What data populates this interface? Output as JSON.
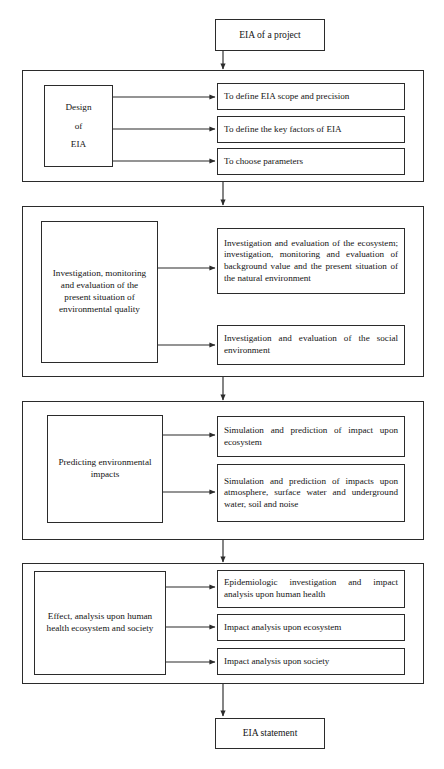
{
  "diagram": {
    "title_box": {
      "label": "EIA of a project"
    },
    "end_box": {
      "label": "EIA statement"
    },
    "stages": [
      {
        "id": "design",
        "stage_label": "Design\n\nof\n\nEIA",
        "stage_label_lines": [
          "Design",
          "of",
          "EIA"
        ],
        "outputs": [
          "To define EIA scope and precision",
          "To define the key factors of EIA",
          "To choose parameters"
        ]
      },
      {
        "id": "investigation",
        "stage_label": "Investigation, monitoring and evaluation of the present situation of environmental quality",
        "outputs": [
          "Investigation and evaluation of the ecosystem; investigation, monitoring and evaluation of background value and the present situation of the natural environment",
          "Investigation and evaluation of the social environment"
        ]
      },
      {
        "id": "prediction",
        "stage_label": "Predicting environmental impacts",
        "outputs": [
          "Simulation and prediction of impact upon ecosystem",
          "Simulation and prediction of impacts upon atmosphere, surface water and underground water, soil and noise"
        ]
      },
      {
        "id": "effect",
        "stage_label": "Effect, analysis upon human health ecosystem and society",
        "outputs": [
          "Epidemiologic investigation and impact analysis upon human health",
          "Impact analysis upon ecosystem",
          "Impact analysis upon society"
        ]
      }
    ],
    "colors": {
      "line": "#2b2b2b",
      "text": "#141414",
      "background": "#ffffff"
    }
  }
}
